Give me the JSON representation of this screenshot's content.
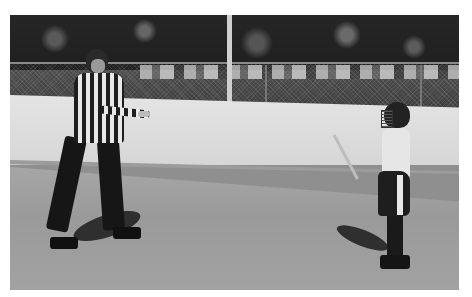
{
  "image": {
    "type": "photograph",
    "style": "grayscale",
    "description": "Inline hockey rink: a referee in a striped shirt and helmet signals with crossed arms toward a young player in a helmet and cage holding a hockey stick, both on inline skates",
    "scene": {
      "background": "trees, chain-link fence, parked vehicles",
      "boards": "light-colored rink boards with dark baseboard",
      "floor": "grey sport court surface"
    },
    "subjects": [
      {
        "role": "referee",
        "attire": "black-and-white striped shirt, black pants, helmet, inline skates",
        "gesture": "arms crossed horizontally at waist"
      },
      {
        "role": "youth player",
        "attire": "helmet with cage, white jersey, dark pants with white stripe, inline skates",
        "equipment": "hockey stick"
      }
    ]
  },
  "colors": {
    "trees": "#222222",
    "boards": "#dedede",
    "floor": "#a0a0a0",
    "baseboard": "#9c9c9c"
  }
}
